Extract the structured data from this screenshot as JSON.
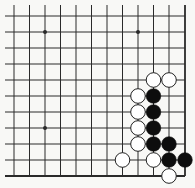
{
  "diagram": {
    "type": "go-board-fragment",
    "visible_corner": "bottom-right",
    "columns": 12,
    "rows": 11,
    "grid": {
      "x": [
        14,
        29.5,
        45,
        60.5,
        76,
        91.5,
        107,
        122.5,
        138,
        153.5,
        169,
        185
      ],
      "y": [
        16,
        32,
        48,
        64,
        80,
        96,
        112,
        128,
        144,
        160,
        176
      ],
      "open_left_x": 5,
      "open_top_y": 5
    },
    "star_points": [
      {
        "col": 2,
        "row": 1
      },
      {
        "col": 8,
        "row": 1
      },
      {
        "col": 2,
        "row": 7
      }
    ],
    "stones": [
      {
        "color": "white",
        "col": 9,
        "row": 4
      },
      {
        "color": "white",
        "col": 10,
        "row": 4
      },
      {
        "color": "white",
        "col": 8,
        "row": 5
      },
      {
        "color": "black",
        "col": 9,
        "row": 5
      },
      {
        "color": "white",
        "col": 8,
        "row": 6
      },
      {
        "color": "black",
        "col": 9,
        "row": 6
      },
      {
        "color": "white",
        "col": 8,
        "row": 7
      },
      {
        "color": "black",
        "col": 9,
        "row": 7
      },
      {
        "color": "white",
        "col": 8,
        "row": 8
      },
      {
        "color": "black",
        "col": 9,
        "row": 8
      },
      {
        "color": "black",
        "col": 10,
        "row": 8
      },
      {
        "color": "white",
        "col": 7,
        "row": 9
      },
      {
        "color": "white",
        "col": 9,
        "row": 9
      },
      {
        "color": "black",
        "col": 10,
        "row": 9
      },
      {
        "color": "black",
        "col": 11,
        "row": 9
      },
      {
        "color": "white",
        "col": 10,
        "row": 10
      }
    ],
    "colors": {
      "background": "#f8f8f6",
      "line": "#2a2a2a",
      "black_stone": "#0d0d0d",
      "white_stone": "#ffffff",
      "white_stone_border": "#222222"
    }
  }
}
